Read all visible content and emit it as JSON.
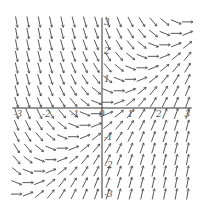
{
  "chart_data": {
    "type": "slope_field",
    "title": "",
    "equation": "dy/dx = x - y",
    "xlabel": "x",
    "ylabel": "y",
    "xlim": [
      -3,
      3
    ],
    "ylim": [
      -3,
      3
    ],
    "grid": false,
    "grid_step": 0.4,
    "x_ticks": [
      -3,
      -2,
      -1,
      0,
      1,
      2,
      3
    ],
    "y_ticks": [
      -3,
      -2,
      -1,
      1,
      2,
      3
    ],
    "x_tick_labels": [
      "-3",
      "-2",
      "-1",
      "0",
      "1",
      "2",
      "3"
    ],
    "y_tick_labels": [
      "-3",
      "-2",
      "-1",
      "1",
      "2",
      "3"
    ],
    "sample_slopes": [
      {
        "x": -3,
        "y": 3,
        "slope": -6
      },
      {
        "x": 3,
        "y": 3,
        "slope": 0
      },
      {
        "x": 3,
        "y": -3,
        "slope": 6
      },
      {
        "x": -3,
        "y": -3,
        "slope": 0
      },
      {
        "x": 0,
        "y": 0,
        "slope": 0
      }
    ]
  },
  "style": {
    "axis_color": "#333333",
    "arrow_color": "#444444",
    "background": "#ffffff"
  },
  "layout": {
    "origin_px": [
      102,
      108
    ],
    "px_per_unit_x": 28.5,
    "px_per_unit_y": 28.7,
    "segment_length_px": 11
  }
}
